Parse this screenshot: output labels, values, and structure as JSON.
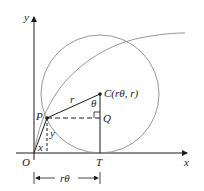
{
  "diagram": {
    "type": "geometry-cycloid",
    "axes": {
      "x_label": "x",
      "y_label": "y",
      "origin_label": "O"
    },
    "points": {
      "P": "P",
      "C": "C(rθ, r)",
      "Q": "Q",
      "T": "T"
    },
    "segment_labels": {
      "radius": "r",
      "angle": "θ",
      "x_coord": "x",
      "y_coord": "y",
      "arc_length": "rθ"
    },
    "colors": {
      "axis": "#1a1a1a",
      "curve": "#8a8a8a",
      "circle": "#8a8a8a",
      "segment": "#1a1a1a"
    }
  }
}
